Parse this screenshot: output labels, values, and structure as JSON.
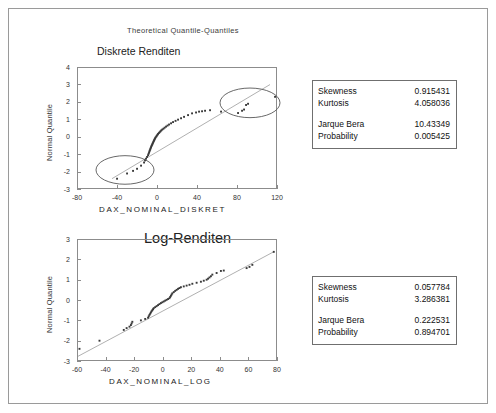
{
  "page": {
    "header": "Theoretical Quantile-Quantiles"
  },
  "charts": [
    {
      "title": "Diskrete Renditen",
      "xlabel": "DAX_NOMINAL_DISKRET",
      "ylabel": "Normal Quantile",
      "stats": {
        "rows_top": [
          {
            "key": "Skewness",
            "value": "0.915431"
          },
          {
            "key": "Kurtosis",
            "value": "4.058036"
          }
        ],
        "rows_bottom": [
          {
            "key": "Jarque Bera",
            "value": "10.43349"
          },
          {
            "key": "Probability",
            "value": "0.005425"
          }
        ]
      },
      "chart_data": {
        "type": "scatter",
        "title": "Diskrete Renditen",
        "xlabel": "DAX_NOMINAL_DISKRET",
        "ylabel": "Normal Quantile",
        "xlim": [
          -80,
          120
        ],
        "ylim": [
          -3,
          4
        ],
        "xticks": [
          -80,
          -40,
          0,
          40,
          80,
          120
        ],
        "yticks": [
          -3,
          -2,
          -1,
          0,
          1,
          2,
          3,
          4
        ],
        "grid": false,
        "legend": null,
        "reference_line": {
          "type": "qq-line",
          "x": [
            -46,
            112
          ],
          "y": [
            -2.35,
            3.05
          ]
        },
        "annotations": [
          {
            "shape": "ellipse",
            "label": "lower-tail-outliers",
            "cx": -33,
            "cy": -1.85,
            "rx": 29,
            "ry": 0.82
          },
          {
            "shape": "ellipse",
            "label": "upper-tail-outliers",
            "cx": 92,
            "cy": 2.0,
            "rx": 30,
            "ry": 0.85
          }
        ],
        "points": [
          [
            -41,
            -2.35
          ],
          [
            -31,
            -2.05
          ],
          [
            -25,
            -1.9
          ],
          [
            -21,
            -1.78
          ],
          [
            -17,
            -1.6
          ],
          [
            -14,
            -1.42
          ],
          [
            -13,
            -1.3
          ],
          [
            -12,
            -1.2
          ],
          [
            -11,
            -1.1
          ],
          [
            -10,
            -1.0
          ],
          [
            -9.5,
            -0.92
          ],
          [
            -9,
            -0.85
          ],
          [
            -8.6,
            -0.78
          ],
          [
            -8.2,
            -0.72
          ],
          [
            -7.8,
            -0.66
          ],
          [
            -7.4,
            -0.6
          ],
          [
            -7,
            -0.54
          ],
          [
            -6.6,
            -0.48
          ],
          [
            -6.2,
            -0.43
          ],
          [
            -5.8,
            -0.38
          ],
          [
            -5.4,
            -0.33
          ],
          [
            -5,
            -0.28
          ],
          [
            -4.6,
            -0.23
          ],
          [
            -4.2,
            -0.18
          ],
          [
            -3.8,
            -0.13
          ],
          [
            -3.4,
            -0.08
          ],
          [
            -3,
            -0.03
          ],
          [
            -2.4,
            0.02
          ],
          [
            -1.8,
            0.07
          ],
          [
            -1.2,
            0.12
          ],
          [
            -0.6,
            0.17
          ],
          [
            0,
            0.22
          ],
          [
            0.8,
            0.27
          ],
          [
            1.6,
            0.32
          ],
          [
            2.4,
            0.37
          ],
          [
            3.2,
            0.42
          ],
          [
            4.2,
            0.47
          ],
          [
            5.4,
            0.52
          ],
          [
            6.6,
            0.58
          ],
          [
            8,
            0.64
          ],
          [
            9.5,
            0.7
          ],
          [
            11,
            0.76
          ],
          [
            13,
            0.83
          ],
          [
            15,
            0.9
          ],
          [
            17.5,
            0.97
          ],
          [
            20,
            1.04
          ],
          [
            23,
            1.12
          ],
          [
            26,
            1.2
          ],
          [
            30,
            1.3
          ],
          [
            34,
            1.4
          ],
          [
            38,
            1.45
          ],
          [
            41,
            1.5
          ],
          [
            44,
            1.52
          ],
          [
            47,
            1.55
          ],
          [
            52,
            1.58
          ],
          [
            63,
            1.5
          ],
          [
            80,
            1.42
          ],
          [
            84,
            1.55
          ],
          [
            86,
            1.62
          ],
          [
            88,
            1.88
          ],
          [
            90,
            1.95
          ],
          [
            117,
            2.35
          ]
        ]
      }
    },
    {
      "title": "Log-Renditen",
      "xlabel": "DAX_NOMINAL_LOG",
      "ylabel": "Normal Quantile",
      "stats": {
        "rows_top": [
          {
            "key": "Skewness",
            "value": "0.057784"
          },
          {
            "key": "Kurtosis",
            "value": "3.286381"
          }
        ],
        "rows_bottom": [
          {
            "key": "Jarque Bera",
            "value": "0.222531"
          },
          {
            "key": "Probability",
            "value": "0.894701"
          }
        ]
      },
      "chart_data": {
        "type": "scatter",
        "title": "Log-Renditen",
        "xlabel": "DAX_NOMINAL_LOG",
        "ylabel": "Normal Quantile",
        "xlim": [
          -60,
          80
        ],
        "ylim": [
          -3,
          3
        ],
        "xticks": [
          -60,
          -40,
          -20,
          0,
          20,
          40,
          60,
          80
        ],
        "yticks": [
          -3,
          -2,
          -1,
          0,
          1,
          2,
          3
        ],
        "grid": false,
        "legend": null,
        "reference_line": {
          "type": "qq-line",
          "x": [
            -60,
            77
          ],
          "y": [
            -2.72,
            2.42
          ]
        },
        "annotations": [],
        "points": [
          [
            -59,
            -2.35
          ],
          [
            -45,
            -1.95
          ],
          [
            -28,
            -1.42
          ],
          [
            -26,
            -1.33
          ],
          [
            -24,
            -1.26
          ],
          [
            -23,
            -1.18
          ],
          [
            -22.5,
            -1.1
          ],
          [
            -22,
            -1.02
          ],
          [
            -16,
            -0.95
          ],
          [
            -13,
            -0.88
          ],
          [
            -11,
            -0.82
          ],
          [
            -10.5,
            -0.75
          ],
          [
            -10,
            -0.68
          ],
          [
            -9.5,
            -0.62
          ],
          [
            -9,
            -0.56
          ],
          [
            -8.5,
            -0.5
          ],
          [
            -8,
            -0.45
          ],
          [
            -7.5,
            -0.4
          ],
          [
            -7,
            -0.35
          ],
          [
            -6,
            -0.3
          ],
          [
            -5,
            -0.25
          ],
          [
            -4,
            -0.2
          ],
          [
            -3,
            -0.15
          ],
          [
            -2,
            -0.1
          ],
          [
            -1,
            -0.06
          ],
          [
            0,
            -0.02
          ],
          [
            1,
            0.02
          ],
          [
            2,
            0.06
          ],
          [
            3,
            0.1
          ],
          [
            4,
            0.14
          ],
          [
            4.5,
            0.2
          ],
          [
            5,
            0.26
          ],
          [
            5.5,
            0.32
          ],
          [
            6,
            0.38
          ],
          [
            7,
            0.44
          ],
          [
            8,
            0.5
          ],
          [
            9,
            0.55
          ],
          [
            10,
            0.6
          ],
          [
            11,
            0.64
          ],
          [
            12,
            0.68
          ],
          [
            14,
            0.72
          ],
          [
            16,
            0.76
          ],
          [
            18,
            0.8
          ],
          [
            20,
            0.85
          ],
          [
            23,
            0.9
          ],
          [
            26,
            0.95
          ],
          [
            28,
            1.0
          ],
          [
            30,
            1.05
          ],
          [
            31,
            1.1
          ],
          [
            32,
            1.16
          ],
          [
            33,
            1.22
          ],
          [
            34,
            1.3
          ],
          [
            37,
            1.38
          ],
          [
            40,
            1.48
          ],
          [
            42,
            1.5
          ],
          [
            58,
            1.62
          ],
          [
            60,
            1.68
          ],
          [
            62,
            1.78
          ],
          [
            77,
            2.42
          ]
        ]
      }
    }
  ]
}
